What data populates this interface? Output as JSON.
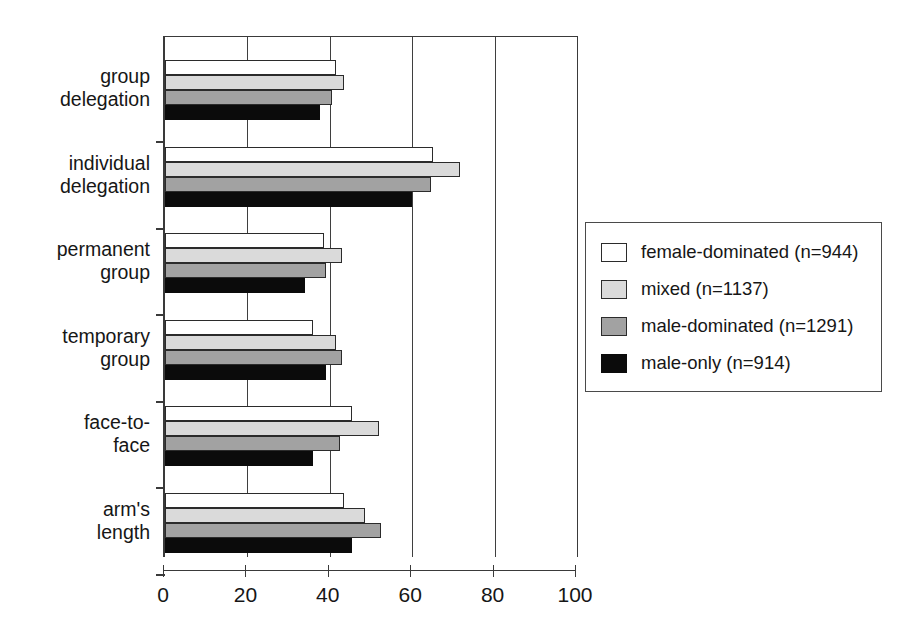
{
  "chart_data": {
    "type": "bar",
    "orientation": "horizontal",
    "title": "",
    "subtitle": "",
    "xlabel": "",
    "ylabel": "",
    "xlim": [
      0,
      100
    ],
    "xticks": [
      0,
      20,
      40,
      60,
      80,
      100
    ],
    "xticklabels": [
      "0",
      "20",
      "40",
      "60",
      "80",
      "100"
    ],
    "grid": "vertical gridlines at 20, 40, 60, 80",
    "legend_position": "right-middle",
    "categories": [
      "group\ndelegation",
      "individual\ndelegation",
      "permanent\ngroup",
      "temporary\ngroup",
      "face-to-\nface",
      "arm's\nlength"
    ],
    "series": [
      {
        "name": "female-dominated (n=944)",
        "short_name": "female-dominated",
        "n": 944,
        "color": "#ffffff",
        "values": [
          41.5,
          65.0,
          38.5,
          36.0,
          45.5,
          43.5
        ]
      },
      {
        "name": "mixed (n=1137)",
        "short_name": "mixed",
        "n": 1137,
        "color": "#dadada",
        "values": [
          43.5,
          71.5,
          43.0,
          41.5,
          52.0,
          48.5
        ]
      },
      {
        "name": "male-dominated (n=1291)",
        "short_name": "male-dominated",
        "n": 1291,
        "color": "#a2a2a2",
        "values": [
          40.5,
          64.5,
          39.0,
          43.0,
          42.5,
          52.5
        ]
      },
      {
        "name": "male-only (n=914)",
        "short_name": "male-only",
        "n": 914,
        "color": "#0b0b0b",
        "values": [
          37.5,
          60.0,
          34.0,
          39.0,
          36.0,
          45.5
        ]
      }
    ]
  },
  "legend": {
    "items": [
      {
        "label": "female-dominated (n=944)",
        "key": "female-dominated"
      },
      {
        "label": "mixed (n=1137)",
        "key": "mixed"
      },
      {
        "label": "male-dominated (n=1291)",
        "key": "male-dominated"
      },
      {
        "label": "male-only (n=914)",
        "key": "male-only"
      }
    ]
  }
}
